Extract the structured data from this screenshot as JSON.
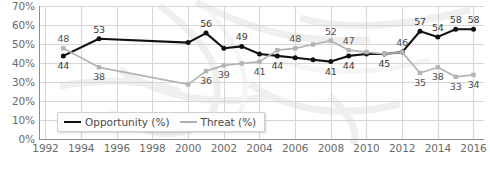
{
  "chart_data": {
    "type": "line",
    "title": "",
    "xlabel": "",
    "ylabel": "",
    "grid": true,
    "legend_position": "bottom-left",
    "xlim": [
      1992,
      2016
    ],
    "ylim": [
      0,
      70
    ],
    "ytick_labels": [
      "70%",
      "60%",
      "50%",
      "40%",
      "30%",
      "20%",
      "10%",
      "0%"
    ],
    "ytick_values": [
      70,
      60,
      50,
      40,
      30,
      20,
      10,
      0
    ],
    "xtick_labels": [
      "1992",
      "1994",
      "1996",
      "1998",
      "2000",
      "2002",
      "2004",
      "2006",
      "2008",
      "2010",
      "2012",
      "2014",
      "2016"
    ],
    "xtick_values": [
      1992,
      1994,
      1996,
      1998,
      2000,
      2002,
      2004,
      2006,
      2008,
      2010,
      2012,
      2014,
      2016
    ],
    "series": [
      {
        "name": "Opportunity (%)",
        "color": "#111111",
        "x": [
          1993,
          1995,
          2000,
          2001,
          2002,
          2003,
          2004,
          2005,
          2006,
          2007,
          2008,
          2009,
          2010,
          2011,
          2012,
          2013,
          2014,
          2015,
          2016
        ],
        "values": [
          44,
          53,
          51,
          56,
          48,
          49,
          45,
          44,
          43,
          42,
          41,
          44,
          45,
          45,
          46,
          57,
          54,
          58,
          58
        ],
        "labels": [
          {
            "x": 1993,
            "y": 44,
            "text": "44",
            "pos": "below"
          },
          {
            "x": 1995,
            "y": 53,
            "text": "53",
            "pos": "above"
          },
          {
            "x": 2001,
            "y": 56,
            "text": "56",
            "pos": "above"
          },
          {
            "x": 2003,
            "y": 49,
            "text": "49",
            "pos": "above"
          },
          {
            "x": 2005,
            "y": 44,
            "text": "44",
            "pos": "below"
          },
          {
            "x": 2008,
            "y": 41,
            "text": "41",
            "pos": "below"
          },
          {
            "x": 2009,
            "y": 44,
            "text": "44",
            "pos": "below"
          },
          {
            "x": 2011,
            "y": 45,
            "text": "45",
            "pos": "below"
          },
          {
            "x": 2013,
            "y": 57,
            "text": "57",
            "pos": "above"
          },
          {
            "x": 2014,
            "y": 54,
            "text": "54",
            "pos": "above"
          },
          {
            "x": 2015,
            "y": 58,
            "text": "58",
            "pos": "above"
          },
          {
            "x": 2016,
            "y": 58,
            "text": "58",
            "pos": "above"
          }
        ]
      },
      {
        "name": "Threat (%)",
        "color": "#b4b4b4",
        "x": [
          1993,
          1995,
          2000,
          2001,
          2002,
          2003,
          2004,
          2005,
          2006,
          2007,
          2008,
          2009,
          2010,
          2011,
          2012,
          2013,
          2014,
          2015,
          2016
        ],
        "values": [
          48,
          38,
          29,
          36,
          39,
          40,
          41,
          47,
          48,
          50,
          52,
          47,
          46,
          45,
          46,
          35,
          38,
          33,
          34
        ],
        "labels": [
          {
            "x": 1993,
            "y": 48,
            "text": "48",
            "pos": "above"
          },
          {
            "x": 1995,
            "y": 38,
            "text": "38",
            "pos": "below"
          },
          {
            "x": 2001,
            "y": 36,
            "text": "36",
            "pos": "below"
          },
          {
            "x": 2002,
            "y": 39,
            "text": "39",
            "pos": "below"
          },
          {
            "x": 2004,
            "y": 41,
            "text": "41",
            "pos": "below"
          },
          {
            "x": 2006,
            "y": 48,
            "text": "48",
            "pos": "above"
          },
          {
            "x": 2008,
            "y": 52,
            "text": "52",
            "pos": "above"
          },
          {
            "x": 2009,
            "y": 47,
            "text": "47",
            "pos": "above"
          },
          {
            "x": 2012,
            "y": 46,
            "text": "46",
            "pos": "above"
          },
          {
            "x": 2013,
            "y": 35,
            "text": "35",
            "pos": "below"
          },
          {
            "x": 2014,
            "y": 38,
            "text": "38",
            "pos": "below"
          },
          {
            "x": 2015,
            "y": 33,
            "text": "33",
            "pos": "below"
          },
          {
            "x": 2016,
            "y": 34,
            "text": "34",
            "pos": "below"
          }
        ]
      }
    ]
  },
  "legend": {
    "items": [
      {
        "label": "Opportunity (%)",
        "swatch": "opp"
      },
      {
        "label": "Threat (%)",
        "swatch": "thr"
      }
    ]
  },
  "colors": {
    "opportunity": "#111111",
    "threat": "#b4b4b4",
    "grid": "#d6d6d6",
    "axis": "#888888",
    "tick_text": "#6a6a6a",
    "label_text": "#3a3a3a"
  }
}
